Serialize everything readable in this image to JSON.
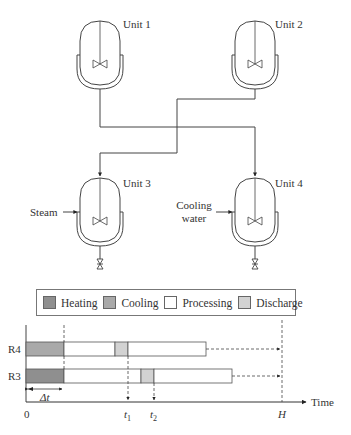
{
  "units": [
    {
      "id": "unit-1",
      "label": "Unit 1"
    },
    {
      "id": "unit-2",
      "label": "Unit 2"
    },
    {
      "id": "unit-3",
      "label": "Unit 3",
      "utility": "Steam"
    },
    {
      "id": "unit-4",
      "label": "Unit 4",
      "utility_line1": "Cooling",
      "utility_line2": "water"
    }
  ],
  "legend": {
    "items": [
      {
        "label": "Heating",
        "color": "#8f8f8f"
      },
      {
        "label": "Cooling",
        "color": "#a9a9a9"
      },
      {
        "label": "Processing",
        "color": "#ffffff"
      },
      {
        "label": "Discharge",
        "color": "#d2d2d2"
      }
    ]
  },
  "gantt": {
    "rows": [
      {
        "label": "R4",
        "segments": [
          {
            "type": "Cooling",
            "start": 0,
            "end": 1
          },
          {
            "type": "Processing",
            "start": 1,
            "end": 2.33
          },
          {
            "type": "Discharge",
            "start": 2.33,
            "end": 2.67
          },
          {
            "type": "Processing",
            "start": 2.67,
            "end": 4.7
          }
        ]
      },
      {
        "label": "R3",
        "segments": [
          {
            "type": "Heating",
            "start": 0,
            "end": 1
          },
          {
            "type": "Processing",
            "start": 1,
            "end": 3.0
          },
          {
            "type": "Discharge",
            "start": 3.0,
            "end": 3.35
          },
          {
            "type": "Processing",
            "start": 3.35,
            "end": 5.4
          }
        ]
      }
    ],
    "axis": {
      "origin_label": "0",
      "t1_label": "t",
      "t1_sub": "1",
      "t2_label": "t",
      "t2_sub": "2",
      "horizon_label": "H",
      "time_label": "Time",
      "delta_label": "Δt"
    }
  }
}
